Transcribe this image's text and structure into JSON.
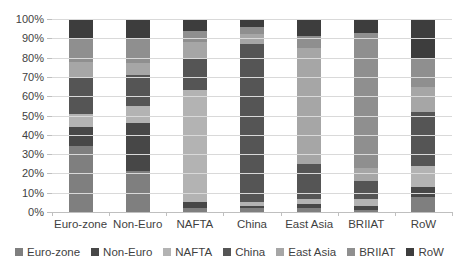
{
  "chart_data": {
    "type": "bar",
    "stacked": true,
    "percent": true,
    "title": "",
    "xlabel": "",
    "ylabel": "",
    "ylim": [
      0,
      100
    ],
    "grid": true,
    "legend_position": "bottom",
    "y_ticks": [
      "100%",
      "90%",
      "80%",
      "70%",
      "60%",
      "50%",
      "40%",
      "30%",
      "20%",
      "10%",
      "0%"
    ],
    "categories": [
      "Euro-zone",
      "Non-Euro",
      "NAFTA",
      "China",
      "East Asia",
      "BRIIAT",
      "RoW"
    ],
    "series": [
      {
        "name": "Euro-zone",
        "color": "#7f7f7f",
        "values": [
          34,
          21,
          2,
          2,
          2,
          1,
          8
        ]
      },
      {
        "name": "Non-Euro",
        "color": "#474747",
        "values": [
          10,
          25,
          3,
          1,
          2,
          2,
          5
        ]
      },
      {
        "name": "NAFTA",
        "color": "#b3b3b3",
        "values": [
          7,
          9,
          58,
          2,
          3,
          4,
          11
        ]
      },
      {
        "name": "China",
        "color": "#555555",
        "values": [
          19,
          16,
          17,
          82,
          18,
          9,
          28
        ]
      },
      {
        "name": "East Asia",
        "color": "#a6a6a6",
        "values": [
          8,
          6,
          8,
          5,
          60,
          7,
          13
        ]
      },
      {
        "name": "BRIIAT",
        "color": "#8f8f8f",
        "values": [
          12,
          13,
          6,
          4,
          6,
          70,
          15
        ]
      },
      {
        "name": "RoW",
        "color": "#3d3d3d",
        "values": [
          10,
          10,
          6,
          4,
          9,
          7,
          20
        ]
      }
    ],
    "colors": {
      "background": "#ffffff",
      "gridline": "#d9d9d9",
      "axis_line": "#bfbfbf",
      "tick_text": "#3f3f3f"
    }
  }
}
